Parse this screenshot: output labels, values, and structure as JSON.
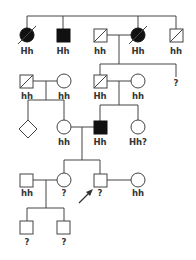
{
  "pedigree": {
    "type": "genetic pedigree chart",
    "colors": {
      "line": "#444444",
      "affected": "#111111",
      "unaffected": "#ffffff"
    },
    "generations": [
      {
        "id": "I",
        "individuals": [
          {
            "id": "I-1",
            "sex": "female",
            "affected": true,
            "deceased": true,
            "genotype": "Hh"
          },
          {
            "id": "I-2",
            "sex": "male",
            "affected": true,
            "deceased": false,
            "genotype": "Hh"
          },
          {
            "id": "I-3",
            "sex": "male",
            "affected": false,
            "deceased": true,
            "genotype": "hh"
          },
          {
            "id": "I-4",
            "sex": "female",
            "affected": true,
            "deceased": true,
            "genotype": "Hh"
          },
          {
            "id": "I-5",
            "sex": "male",
            "affected": false,
            "deceased": true,
            "genotype": "hh"
          }
        ]
      },
      {
        "id": "II",
        "individuals": [
          {
            "id": "II-1",
            "sex": "male",
            "affected": false,
            "deceased": true,
            "genotype": "hh"
          },
          {
            "id": "II-2",
            "sex": "female",
            "affected": false,
            "deceased": false,
            "genotype": "hh"
          },
          {
            "id": "II-3",
            "sex": "male",
            "affected": false,
            "deceased": true,
            "genotype": "Hh"
          },
          {
            "id": "II-4",
            "sex": "female",
            "affected": false,
            "deceased": false,
            "genotype": "hh"
          },
          {
            "id": "II-5",
            "sex": "unknown",
            "affected": false,
            "deceased": false,
            "genotype": "?"
          }
        ]
      },
      {
        "id": "III",
        "individuals": [
          {
            "id": "III-1",
            "sex": "unknown",
            "affected": false,
            "deceased": false,
            "genotype": ""
          },
          {
            "id": "III-2",
            "sex": "female",
            "affected": false,
            "deceased": false,
            "genotype": "hh"
          },
          {
            "id": "III-3",
            "sex": "male",
            "affected": true,
            "deceased": false,
            "genotype": "Hh"
          },
          {
            "id": "III-4",
            "sex": "female",
            "affected": false,
            "deceased": false,
            "genotype": "Hh?"
          }
        ]
      },
      {
        "id": "IV",
        "individuals": [
          {
            "id": "IV-1",
            "sex": "male",
            "affected": false,
            "deceased": false,
            "genotype": "hh"
          },
          {
            "id": "IV-2",
            "sex": "female",
            "affected": false,
            "deceased": false,
            "genotype": "?"
          },
          {
            "id": "IV-3",
            "sex": "male",
            "affected": false,
            "deceased": false,
            "genotype": "?",
            "proband": true
          },
          {
            "id": "IV-4",
            "sex": "female",
            "affected": false,
            "deceased": false,
            "genotype": "hh"
          }
        ]
      },
      {
        "id": "V",
        "individuals": [
          {
            "id": "V-1",
            "sex": "male",
            "affected": false,
            "deceased": false,
            "genotype": "?"
          },
          {
            "id": "V-2",
            "sex": "male",
            "affected": false,
            "deceased": false,
            "genotype": "?"
          }
        ]
      }
    ],
    "labels": {
      "I1": "Hh",
      "I2": "Hh",
      "I3": "hh",
      "I4": "Hh",
      "I5": "hh",
      "II1": "hh",
      "II2": "hh",
      "II3": "Hh",
      "II4": "hh",
      "II5": "?",
      "III2": "hh",
      "III3": "Hh",
      "III4": "Hh?",
      "IV1": "hh",
      "IV2": "?",
      "IV3": "?",
      "IV4": "hh",
      "V1": "?",
      "V2": "?"
    }
  }
}
